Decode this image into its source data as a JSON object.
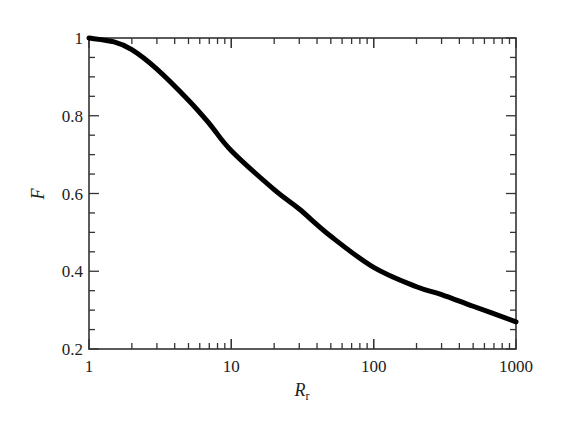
{
  "chart_data": {
    "type": "line",
    "title": "",
    "xlabel": "R_r",
    "xlabel_main": "R",
    "xlabel_sub": "r",
    "ylabel": "F",
    "xscale": "log",
    "xlim": [
      1,
      1000
    ],
    "ylim": [
      0.2,
      1.0
    ],
    "grid": false,
    "legend": null,
    "x_ticks": [
      "1",
      "10",
      "100",
      "1000"
    ],
    "y_ticks": [
      "0.2",
      "0.4",
      "0.6",
      "0.8",
      "1"
    ],
    "series": [
      {
        "name": "F",
        "x": [
          1,
          1.5,
          2,
          3,
          5,
          7,
          10,
          20,
          30,
          50,
          100,
          200,
          300,
          500,
          1000
        ],
        "values": [
          1.0,
          0.99,
          0.97,
          0.92,
          0.84,
          0.78,
          0.71,
          0.61,
          0.56,
          0.49,
          0.41,
          0.36,
          0.34,
          0.31,
          0.27
        ]
      }
    ],
    "colors": {
      "line": "#000000",
      "axis": "#333333"
    }
  }
}
